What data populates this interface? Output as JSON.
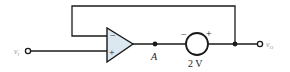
{
  "diagram": {
    "type": "circuit-schematic",
    "input_terminal": {
      "label_main": "v",
      "label_sub": "I"
    },
    "output_terminal": {
      "label_main": "v",
      "label_sub": "O"
    },
    "opamp": {
      "inverting_sign": "−",
      "noninverting_sign": "+"
    },
    "node_a": {
      "label": "A"
    },
    "voltage_source": {
      "value_label": "2 V",
      "neg_sign": "−",
      "pos_sign": "+"
    },
    "colors": {
      "line": "#1a1a1a",
      "opamp_fill": "#dce8f0",
      "terminal_label": "#9a9a9a"
    }
  }
}
